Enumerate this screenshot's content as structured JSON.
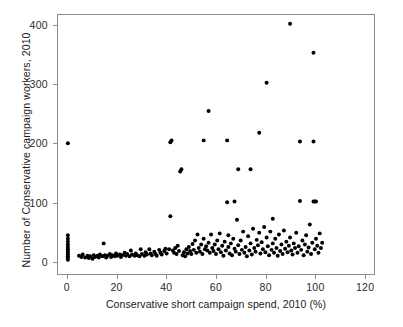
{
  "figure": {
    "top_caption_fragment": "",
    "background_color": "#ffffff",
    "frame_color": "#8d8d8d",
    "point_color": "#000000"
  },
  "chart_data": {
    "type": "scatter",
    "title": "",
    "xlabel": "Conservative short campaign spend, 2010 (%)",
    "ylabel": "Number of Conservative campaign workers, 2010",
    "xlim": [
      -4,
      124
    ],
    "ylim": [
      -22,
      418
    ],
    "xticks": [
      0,
      20,
      40,
      60,
      80,
      100,
      120
    ],
    "xtick_labels": [
      "0",
      "20",
      "40",
      "60",
      "80",
      "100",
      "120"
    ],
    "yticks": [
      0,
      100,
      200,
      300,
      400
    ],
    "ytick_labels": [
      "0",
      "100",
      "200",
      "300",
      "400"
    ],
    "grid": false,
    "legend": null,
    "marker": "circle",
    "marker_size_px": 3.2,
    "marker_color": "#000000",
    "points": [
      [
        0,
        2
      ],
      [
        0,
        5
      ],
      [
        0,
        8
      ],
      [
        0,
        11
      ],
      [
        0,
        14
      ],
      [
        0,
        17
      ],
      [
        0,
        20
      ],
      [
        0,
        24
      ],
      [
        0,
        28
      ],
      [
        0,
        33
      ],
      [
        0,
        38
      ],
      [
        0,
        44
      ],
      [
        0,
        200
      ],
      [
        4.5,
        9
      ],
      [
        5.5,
        7
      ],
      [
        6,
        11
      ],
      [
        7,
        6
      ],
      [
        8,
        9
      ],
      [
        8.5,
        5
      ],
      [
        9,
        8
      ],
      [
        10,
        4
      ],
      [
        10.5,
        10
      ],
      [
        11,
        7
      ],
      [
        12,
        9
      ],
      [
        12.5,
        6
      ],
      [
        13,
        11
      ],
      [
        14,
        8
      ],
      [
        14.5,
        30
      ],
      [
        15,
        10
      ],
      [
        15.5,
        6
      ],
      [
        16,
        9
      ],
      [
        17,
        12
      ],
      [
        17.5,
        7
      ],
      [
        18,
        10
      ],
      [
        19,
        8
      ],
      [
        19.5,
        13
      ],
      [
        20,
        9
      ],
      [
        21,
        11
      ],
      [
        21.5,
        7
      ],
      [
        22,
        10
      ],
      [
        23,
        14
      ],
      [
        23.5,
        9
      ],
      [
        24,
        12
      ],
      [
        25,
        8
      ],
      [
        25.5,
        18
      ],
      [
        26,
        11
      ],
      [
        27,
        9
      ],
      [
        27.5,
        13
      ],
      [
        28,
        10
      ],
      [
        29,
        8
      ],
      [
        29.5,
        20
      ],
      [
        30,
        12
      ],
      [
        31,
        9
      ],
      [
        31.5,
        15
      ],
      [
        32,
        11
      ],
      [
        33,
        20
      ],
      [
        33.5,
        13
      ],
      [
        34,
        10
      ],
      [
        35,
        16
      ],
      [
        35.5,
        12
      ],
      [
        36,
        9
      ],
      [
        37,
        19
      ],
      [
        37.5,
        14
      ],
      [
        38,
        11
      ],
      [
        39,
        17
      ],
      [
        39.5,
        21
      ],
      [
        40,
        13
      ],
      [
        41,
        20
      ],
      [
        41.5,
        202
      ],
      [
        41.5,
        76
      ],
      [
        42,
        205
      ],
      [
        42.5,
        18
      ],
      [
        43,
        14
      ],
      [
        43.5,
        22
      ],
      [
        44,
        12
      ],
      [
        44.5,
        26
      ],
      [
        45,
        17
      ],
      [
        45.5,
        152
      ],
      [
        46,
        156
      ],
      [
        46.5,
        10
      ],
      [
        47,
        15
      ],
      [
        47.5,
        8
      ],
      [
        48,
        20
      ],
      [
        48.5,
        13
      ],
      [
        49,
        24
      ],
      [
        49.5,
        17
      ],
      [
        50,
        12
      ],
      [
        50.5,
        29
      ],
      [
        51,
        19
      ],
      [
        51.5,
        35
      ],
      [
        52,
        14
      ],
      [
        52.5,
        45
      ],
      [
        53,
        22
      ],
      [
        53.5,
        16
      ],
      [
        54,
        28
      ],
      [
        54.5,
        12
      ],
      [
        55,
        205
      ],
      [
        55,
        38
      ],
      [
        55.5,
        20
      ],
      [
        56,
        25
      ],
      [
        56.5,
        18
      ],
      [
        57,
        255
      ],
      [
        57,
        31
      ],
      [
        57.5,
        14
      ],
      [
        58,
        45
      ],
      [
        58.5,
        22
      ],
      [
        59,
        17
      ],
      [
        59.5,
        28
      ],
      [
        60,
        12
      ],
      [
        60.5,
        35
      ],
      [
        61,
        20
      ],
      [
        61.5,
        47
      ],
      [
        62,
        15
      ],
      [
        62.5,
        26
      ],
      [
        63,
        9
      ],
      [
        63.5,
        33
      ],
      [
        64,
        18
      ],
      [
        64.5,
        205
      ],
      [
        64.5,
        100
      ],
      [
        65,
        24
      ],
      [
        65,
        44
      ],
      [
        65.5,
        13
      ],
      [
        66,
        30
      ],
      [
        66.5,
        10
      ],
      [
        67,
        38
      ],
      [
        67.5,
        101
      ],
      [
        67.5,
        21
      ],
      [
        68,
        16
      ],
      [
        68.5,
        70
      ],
      [
        69,
        156
      ],
      [
        69,
        27
      ],
      [
        69.5,
        12
      ],
      [
        70,
        35
      ],
      [
        70.5,
        19
      ],
      [
        71,
        50
      ],
      [
        71.5,
        14
      ],
      [
        72,
        24
      ],
      [
        72.5,
        8
      ],
      [
        73,
        42
      ],
      [
        73.5,
        18
      ],
      [
        74,
        156
      ],
      [
        74,
        30
      ],
      [
        74.5,
        11
      ],
      [
        75,
        55
      ],
      [
        75.5,
        22
      ],
      [
        76,
        16
      ],
      [
        76.5,
        36
      ],
      [
        77,
        27
      ],
      [
        77.5,
        218
      ],
      [
        77.5,
        48
      ],
      [
        78,
        13
      ],
      [
        78.5,
        32
      ],
      [
        79,
        20
      ],
      [
        79.5,
        58
      ],
      [
        80,
        15
      ],
      [
        80.5,
        303
      ],
      [
        80.5,
        40
      ],
      [
        81,
        25
      ],
      [
        81.5,
        10
      ],
      [
        82,
        50
      ],
      [
        82.5,
        19
      ],
      [
        83,
        72
      ],
      [
        83,
        30
      ],
      [
        83.5,
        14
      ],
      [
        84,
        38
      ],
      [
        84.5,
        22
      ],
      [
        85,
        9
      ],
      [
        85.5,
        45
      ],
      [
        86,
        17
      ],
      [
        86.5,
        28
      ],
      [
        87,
        12
      ],
      [
        87.5,
        52
      ],
      [
        88,
        21
      ],
      [
        88.5,
        33
      ],
      [
        89,
        15
      ],
      [
        89.5,
        26
      ],
      [
        90,
        403
      ],
      [
        90,
        40
      ],
      [
        90.5,
        18
      ],
      [
        91,
        11
      ],
      [
        91.5,
        30
      ],
      [
        92,
        22
      ],
      [
        92.5,
        48
      ],
      [
        93,
        14
      ],
      [
        93.5,
        25
      ],
      [
        94,
        203
      ],
      [
        94,
        102
      ],
      [
        94.5,
        19
      ],
      [
        95,
        35
      ],
      [
        95.5,
        10
      ],
      [
        96,
        28
      ],
      [
        96.5,
        44
      ],
      [
        97,
        16
      ],
      [
        97.5,
        23
      ],
      [
        98,
        62
      ],
      [
        98.5,
        12
      ],
      [
        99,
        31
      ],
      [
        99.5,
        354
      ],
      [
        99.5,
        203
      ],
      [
        99.5,
        101
      ],
      [
        100,
        101
      ],
      [
        100,
        20
      ],
      [
        100.5,
        101
      ],
      [
        100.5,
        38
      ],
      [
        101,
        26
      ],
      [
        101.5,
        14
      ],
      [
        102,
        47
      ],
      [
        102.5,
        22
      ],
      [
        103,
        31
      ]
    ]
  }
}
